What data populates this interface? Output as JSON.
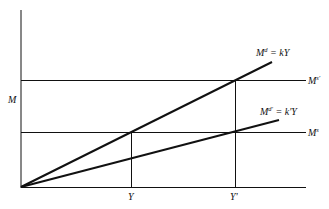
{
  "diagram": {
    "y_axis_label": "M",
    "x_ticks": [
      {
        "label": "Y"
      },
      {
        "label": "Y'"
      }
    ],
    "lines": {
      "steep": {
        "lhs": "M",
        "sup": "d",
        "rhs": " = kY"
      },
      "shallow": {
        "lhs": "M",
        "sup": "d'",
        "rhs": " = k'Y"
      }
    },
    "horizontal_labels": {
      "upper": {
        "base": "M",
        "sup": "s'"
      },
      "lower": {
        "base": "M",
        "sup": "s"
      }
    },
    "colors": {
      "ink": "#111111",
      "background": "#ffffff"
    }
  }
}
